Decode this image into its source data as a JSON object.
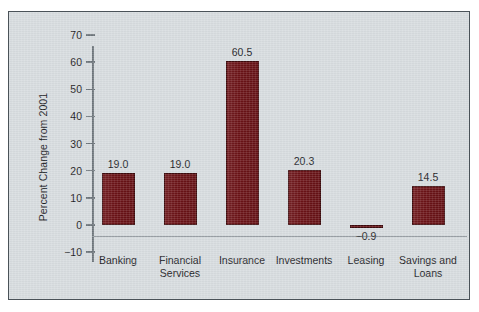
{
  "chart_data": {
    "type": "bar",
    "title": "",
    "subtitle": "",
    "xlabel": "",
    "ylabel": "Percent Change from 2001",
    "categories": [
      "Banking",
      "Financial\nServices",
      "Insurance",
      "Investments",
      "Leasing",
      "Savings and\nLoans"
    ],
    "values": [
      19.0,
      19.0,
      60.5,
      20.3,
      -0.9,
      14.5
    ],
    "value_labels": [
      "19.0",
      "19.0",
      "60.5",
      "20.3",
      "−0.9",
      "14.5"
    ],
    "ylim": [
      -10,
      70
    ],
    "yticks": [
      -10,
      0,
      10,
      20,
      30,
      40,
      50,
      60,
      70
    ],
    "ytick_labels": [
      "−10",
      "0",
      "10",
      "20",
      "30",
      "40",
      "50",
      "60",
      "70"
    ],
    "grid": false,
    "legend": null,
    "legend_position": "none",
    "bar_color": "#6B1216",
    "background_color": "#D7DCDF",
    "axis_color": "#6E767C",
    "text_color": "#1D2226",
    "frame_border_color": "#4A5258"
  }
}
